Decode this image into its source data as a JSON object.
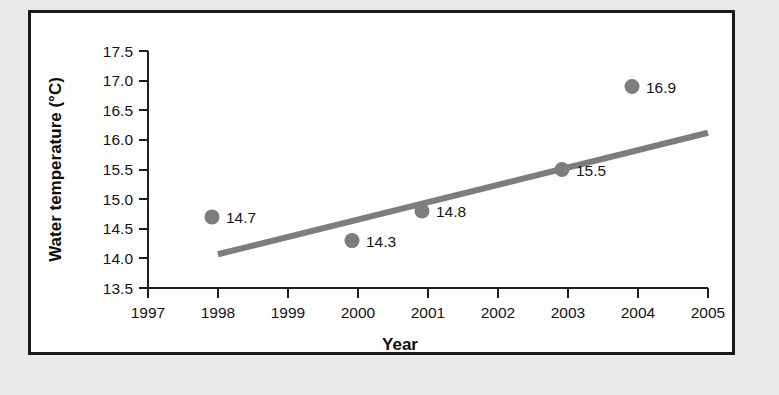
{
  "figure": {
    "frame_color": "#1a1a1a",
    "panel_background": "#ffffff",
    "page_background": "#e9e9e9"
  },
  "chart_data": {
    "type": "scatter",
    "title": "",
    "subtitle": "",
    "xlabel": "Year",
    "ylabel": "Water temperature (°C)",
    "xlim": [
      1997,
      2005
    ],
    "ylim": [
      13.5,
      17.5
    ],
    "xticks": [
      1997,
      1998,
      1999,
      2000,
      2001,
      2002,
      2003,
      2004,
      2005
    ],
    "xtick_labels": [
      "1997",
      "1998",
      "1999",
      "2000",
      "2001",
      "2002",
      "2003",
      "2004",
      "2005"
    ],
    "yticks": [
      13.5,
      14.0,
      14.5,
      15.0,
      15.5,
      16.0,
      16.5,
      17.0,
      17.5
    ],
    "ytick_labels": [
      "13.5",
      "14.0",
      "14.5",
      "15.0",
      "15.5",
      "16.0",
      "16.5",
      "17.0",
      "17.5"
    ],
    "grid": false,
    "legend": null,
    "marker_color": "#7d7d7d",
    "trendline_color": "#7d7d7d",
    "series": [
      {
        "name": "Water temperature",
        "x": [
          1998,
          2000,
          2001,
          2003,
          2004
        ],
        "y": [
          14.7,
          14.3,
          14.8,
          15.5,
          16.9
        ],
        "point_labels": [
          "14.7",
          "14.3",
          "14.8",
          "15.5",
          "16.9"
        ]
      }
    ],
    "trendline": {
      "type": "linear",
      "x_start": 1998.0,
      "y_start": 14.07,
      "x_end": 2005.0,
      "y_end": 16.12
    },
    "annotations": []
  }
}
